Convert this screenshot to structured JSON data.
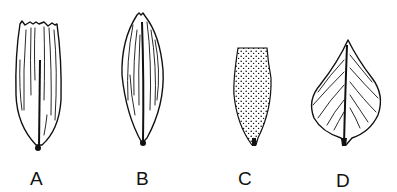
{
  "figure": {
    "items": [
      {
        "label": "A",
        "shape": "truncate-toothed elongate seed with longitudinal ribs"
      },
      {
        "label": "B",
        "shape": "fusiform seed with longitudinal ribs"
      },
      {
        "label": "C",
        "shape": "truncate clavate seed with stippled surface"
      },
      {
        "label": "D",
        "shape": "ovate-acuminate seed with oblique veins and central rib"
      }
    ]
  }
}
